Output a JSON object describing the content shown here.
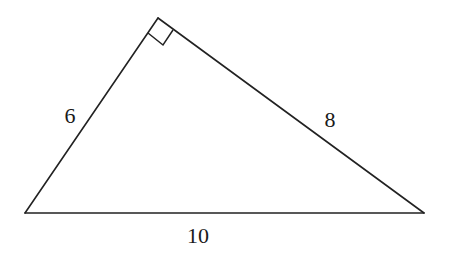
{
  "diagram": {
    "type": "right-triangle",
    "colors": {
      "stroke": "#222222",
      "text": "#1a1a1a",
      "background": "#ffffff"
    },
    "vertices": {
      "left": {
        "x": 25,
        "y": 213
      },
      "top": {
        "x": 158,
        "y": 18
      },
      "right": {
        "x": 424,
        "y": 213
      }
    },
    "right_angle_at": "top",
    "sides": [
      {
        "id": "left-leg",
        "from": "left",
        "to": "top",
        "label": "6",
        "label_pos": {
          "x": 70,
          "y": 116
        }
      },
      {
        "id": "right-leg",
        "from": "top",
        "to": "right",
        "label": "8",
        "label_pos": {
          "x": 330,
          "y": 120
        }
      },
      {
        "id": "hypotenuse",
        "from": "left",
        "to": "right",
        "label": "10",
        "label_pos": {
          "x": 198,
          "y": 236
        }
      }
    ]
  }
}
